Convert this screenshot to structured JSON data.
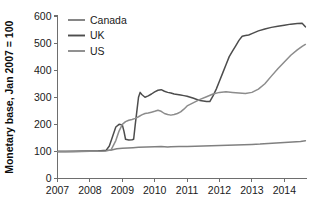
{
  "chart_data": {
    "type": "line",
    "title": "",
    "subtitle": "",
    "xlabel": "",
    "ylabel": "Monetary base, Jan 2007 = 100",
    "xlim": [
      2007.0,
      2014.7
    ],
    "ylim": [
      0,
      600
    ],
    "grid": false,
    "legend_position": "top-left",
    "x_ticks": [
      "2007",
      "2008",
      "2009",
      "2010",
      "2011",
      "2012",
      "2013",
      "2014"
    ],
    "x_tick_values": [
      2007,
      2008,
      2009,
      2010,
      2011,
      2012,
      2013,
      2014
    ],
    "y_ticks": [
      "0",
      "100",
      "200",
      "300",
      "400",
      "500",
      "600"
    ],
    "y_tick_values": [
      0,
      100,
      200,
      300,
      400,
      500,
      600
    ],
    "colors": {
      "canada": "#808080",
      "uk": "#4d4d4d",
      "us": "#8c8c8c",
      "axis": "#6e6e6e",
      "text": "#1a1a1a"
    },
    "series": [
      {
        "name": "Canada",
        "color": "#808080",
        "x": [
          2007.0,
          2007.25,
          2007.5,
          2007.75,
          2008.0,
          2008.25,
          2008.5,
          2008.67,
          2008.83,
          2009.0,
          2009.17,
          2009.33,
          2009.5,
          2009.75,
          2010.0,
          2010.2,
          2010.4,
          2010.5,
          2010.75,
          2011.0,
          2011.25,
          2011.5,
          2011.75,
          2012.0,
          2012.25,
          2012.5,
          2012.75,
          2013.0,
          2013.25,
          2013.5,
          2013.75,
          2014.0,
          2014.25,
          2014.5,
          2014.65
        ],
        "values": [
          100,
          100,
          101,
          101,
          102,
          102,
          103,
          105,
          110,
          112,
          113,
          114,
          115,
          116,
          117,
          118,
          116,
          117,
          118,
          118,
          119,
          120,
          121,
          122,
          123,
          124,
          125,
          126,
          127,
          129,
          131,
          133,
          135,
          137,
          139
        ]
      },
      {
        "name": "UK",
        "color": "#4d4d4d",
        "x": [
          2007.0,
          2007.25,
          2007.5,
          2007.75,
          2008.0,
          2008.25,
          2008.5,
          2008.6,
          2008.7,
          2008.8,
          2008.9,
          2009.0,
          2009.05,
          2009.1,
          2009.2,
          2009.3,
          2009.35,
          2009.4,
          2009.45,
          2009.5,
          2009.55,
          2009.6,
          2009.7,
          2009.8,
          2009.9,
          2010.0,
          2010.1,
          2010.2,
          2010.3,
          2010.4,
          2010.5,
          2010.6,
          2010.7,
          2010.8,
          2010.9,
          2011.0,
          2011.1,
          2011.2,
          2011.3,
          2011.4,
          2011.5,
          2011.6,
          2011.7,
          2011.8,
          2011.9,
          2012.0,
          2012.1,
          2012.2,
          2012.3,
          2012.4,
          2012.5,
          2012.6,
          2012.7,
          2012.8,
          2012.9,
          2013.0,
          2013.2,
          2013.4,
          2013.6,
          2013.8,
          2014.0,
          2014.2,
          2014.4,
          2014.55,
          2014.65
        ],
        "values": [
          100,
          100,
          100,
          101,
          101,
          102,
          104,
          120,
          155,
          190,
          200,
          198,
          175,
          145,
          142,
          143,
          145,
          200,
          250,
          300,
          318,
          310,
          300,
          305,
          312,
          320,
          326,
          328,
          322,
          318,
          316,
          312,
          310,
          308,
          306,
          304,
          300,
          296,
          292,
          288,
          286,
          284,
          284,
          305,
          330,
          360,
          390,
          420,
          450,
          470,
          490,
          510,
          525,
          528,
          530,
          535,
          545,
          552,
          558,
          562,
          566,
          570,
          572,
          573,
          560
        ]
      },
      {
        "name": "US",
        "color": "#8c8c8c",
        "x": [
          2007.0,
          2007.25,
          2007.5,
          2007.75,
          2008.0,
          2008.25,
          2008.5,
          2008.65,
          2008.8,
          2008.9,
          2009.0,
          2009.1,
          2009.2,
          2009.3,
          2009.4,
          2009.5,
          2009.6,
          2009.7,
          2009.8,
          2009.9,
          2010.0,
          2010.1,
          2010.2,
          2010.3,
          2010.4,
          2010.5,
          2010.6,
          2010.7,
          2010.8,
          2010.9,
          2011.0,
          2011.2,
          2011.4,
          2011.6,
          2011.8,
          2012.0,
          2012.2,
          2012.4,
          2012.6,
          2012.8,
          2013.0,
          2013.2,
          2013.4,
          2013.6,
          2013.8,
          2014.0,
          2014.2,
          2014.4,
          2014.55,
          2014.65
        ],
        "values": [
          100,
          100,
          100,
          100,
          101,
          101,
          102,
          105,
          140,
          175,
          200,
          210,
          215,
          218,
          222,
          228,
          235,
          240,
          242,
          245,
          248,
          252,
          248,
          240,
          236,
          234,
          236,
          240,
          246,
          256,
          268,
          280,
          292,
          302,
          312,
          318,
          320,
          318,
          316,
          314,
          318,
          330,
          350,
          378,
          405,
          430,
          455,
          475,
          488,
          495
        ]
      }
    ]
  },
  "legend": {
    "items": [
      {
        "label": "Canada",
        "color": "#808080"
      },
      {
        "label": "UK",
        "color": "#4d4d4d"
      },
      {
        "label": "US",
        "color": "#8c8c8c"
      }
    ]
  },
  "axes": {
    "y_title": "Monetary base, Jan 2007 = 100"
  }
}
